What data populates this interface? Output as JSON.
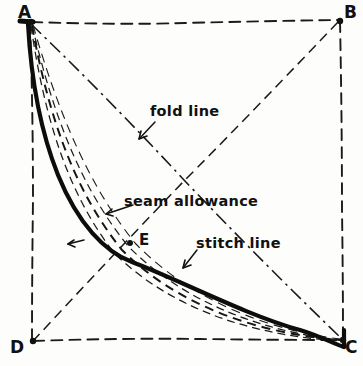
{
  "figure": {
    "type": "hand-drawn sewing pattern diagram",
    "background_color": "#fdfdfc",
    "ink_color": "#111111",
    "width": 363,
    "height": 366
  },
  "corners": [
    {
      "id": "A",
      "label": "A",
      "x": 30,
      "y": 22,
      "label_x": 18,
      "label_y": 2
    },
    {
      "id": "B",
      "label": "B",
      "x": 340,
      "y": 20,
      "label_x": 344,
      "label_y": 2
    },
    {
      "id": "C",
      "label": "C",
      "x": 343,
      "y": 340,
      "label_x": 345,
      "label_y": 337
    },
    {
      "id": "D",
      "label": "D",
      "x": 32,
      "y": 341,
      "label_x": 10,
      "label_y": 337
    }
  ],
  "points": [
    {
      "id": "E",
      "label": "E",
      "x": 130,
      "y": 243,
      "label_x": 139,
      "label_y": 231
    }
  ],
  "annotations": [
    {
      "id": "fold-line",
      "label": "fold line",
      "x": 150,
      "y": 103
    },
    {
      "id": "seam-allowance",
      "label": "seam allowance",
      "x": 124,
      "y": 193
    },
    {
      "id": "stitch-line",
      "label": "stitch line",
      "x": 196,
      "y": 235
    }
  ],
  "lines": {
    "square_edges": [
      {
        "id": "edge-AB",
        "from": "A",
        "to": "B",
        "style": "dashed"
      },
      {
        "id": "edge-BC",
        "from": "B",
        "to": "C",
        "style": "dashed"
      },
      {
        "id": "edge-DC",
        "from": "D",
        "to": "C",
        "style": "dashed"
      },
      {
        "id": "edge-AD",
        "from": "A",
        "to": "D",
        "style": "dashed"
      }
    ],
    "diagonals": [
      {
        "id": "diagonal-AC",
        "from": "A",
        "to": "C",
        "style": "dash-dot",
        "meaning": "fold line"
      },
      {
        "id": "diagonal-BD",
        "from": "B",
        "to": "D",
        "style": "dashed"
      }
    ]
  },
  "curves": [
    {
      "id": "cut-line-curve",
      "style": "solid-thick",
      "meaning": "cutting line",
      "from": "A",
      "to": "C"
    },
    {
      "id": "seam-allowance-curve-1",
      "style": "dashed-thin",
      "meaning": "seam allowance",
      "from": "A",
      "to": "C"
    },
    {
      "id": "seam-allowance-curve-2",
      "style": "dashed-thin",
      "meaning": "seam allowance",
      "from": "A",
      "to": "C"
    },
    {
      "id": "stitch-line-curve",
      "style": "dashed-medium",
      "meaning": "stitch line",
      "from": "A",
      "to": "C"
    },
    {
      "id": "inner-guide-curve",
      "style": "dashed-thin",
      "meaning": "guide",
      "from": "A",
      "to": "C"
    }
  ],
  "leaders": [
    {
      "id": "leader-fold-line",
      "target": "diagonal-AC"
    },
    {
      "id": "leader-seam-allowance",
      "target": "seam-allowance-curve-1"
    },
    {
      "id": "leader-stitch-line",
      "target": "stitch-line-curve"
    },
    {
      "id": "leader-cut-line",
      "target": "cut-line-curve"
    }
  ]
}
